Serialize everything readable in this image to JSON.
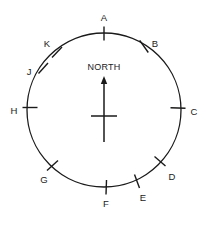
{
  "figure": {
    "name": "compass-circle-diagram",
    "type": "diagram",
    "background_color": "#ffffff",
    "line_color": "#1a1a1a"
  },
  "circle": {
    "center_x": 104,
    "center_y": 110,
    "radius": 77,
    "stroke_color": "#1a1a1a",
    "stroke_width": 1.3
  },
  "north_indicator": {
    "label": "NORTH",
    "label_x": 104,
    "label_y": 68,
    "shaft_x": 104,
    "shaft_top_y": 80,
    "shaft_bottom_y": 142,
    "crossbar_y": 116,
    "crossbar_half_width": 13,
    "arrowhead_tip_y": 76,
    "arrowhead_half_width": 3.2,
    "arrowhead_height": 8
  },
  "points": [
    {
      "label": "A",
      "angle_deg": 0,
      "tick_x1": 104.0,
      "tick_y1": 26.5,
      "tick_x2": 104.0,
      "tick_y2": 40.5,
      "label_x": 104,
      "label_y": 18
    },
    {
      "label": "B",
      "angle_deg": 35,
      "tick_x1": 139.7,
      "tick_y1": 40.3,
      "tick_x2": 148.3,
      "tick_y2": 52.5,
      "label_x": 155,
      "label_y": 44
    },
    {
      "label": "C",
      "angle_deg": 88,
      "tick_x1": 170.5,
      "tick_y1": 107.7,
      "tick_x2": 185.5,
      "tick_y2": 108.2,
      "label_x": 194,
      "label_y": 112
    },
    {
      "label": "D",
      "angle_deg": 128,
      "tick_x1": 154.5,
      "tick_y1": 156.5,
      "tick_x2": 165.5,
      "tick_y2": 166.0,
      "label_x": 172,
      "label_y": 177
    },
    {
      "label": "E",
      "angle_deg": 155,
      "tick_x1": 134.5,
      "tick_y1": 174.5,
      "tick_x2": 139.5,
      "tick_y2": 188.0,
      "label_x": 143,
      "label_y": 198
    },
    {
      "label": "F",
      "angle_deg": 178,
      "tick_x1": 106.5,
      "tick_y1": 180.0,
      "tick_x2": 106.0,
      "tick_y2": 194.5,
      "label_x": 106,
      "label_y": 204
    },
    {
      "label": "G",
      "angle_deg": 222,
      "tick_x1": 58.0,
      "tick_y1": 160.5,
      "tick_x2": 47.0,
      "tick_y2": 170.5,
      "label_x": 44,
      "label_y": 180
    },
    {
      "label": "H",
      "angle_deg": 268,
      "tick_x1": 37.5,
      "tick_y1": 107.5,
      "tick_x2": 22.5,
      "tick_y2": 107.5,
      "label_x": 14,
      "label_y": 111
    },
    {
      "label": "J",
      "angle_deg": 305,
      "tick_x1": 48.0,
      "tick_y1": 63.0,
      "tick_x2": 38.5,
      "tick_y2": 73.5,
      "label_x": 29,
      "label_y": 72
    },
    {
      "label": "K",
      "angle_deg": 322,
      "tick_x1": 62.0,
      "tick_y1": 47.0,
      "tick_x2": 52.0,
      "tick_y2": 57.5,
      "label_x": 47,
      "label_y": 44
    }
  ]
}
